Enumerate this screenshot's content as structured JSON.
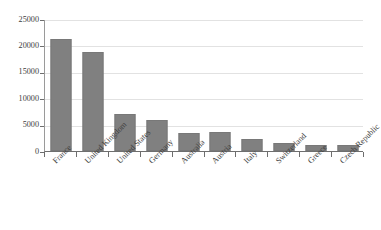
{
  "chart_data": {
    "type": "bar",
    "title": "",
    "xlabel": "",
    "ylabel": "",
    "grid": true,
    "legend": false,
    "ylim": [
      0,
      25000
    ],
    "ytick_values": [
      0,
      5000,
      10000,
      15000,
      20000,
      25000
    ],
    "ytick_labels": [
      "0",
      "5000",
      "10000",
      "15000",
      "20000",
      "25000"
    ],
    "bar_color": "#808080",
    "gridline_color": "#e2e2e2",
    "axis_color": "#6e6e6e",
    "background": "#ffffff",
    "categories": [
      "France",
      "United Kingdom",
      "United States",
      "Germany",
      "Australia",
      "Austria",
      "Italy",
      "Switzerland",
      "Greece",
      "Czech Republic"
    ],
    "values": [
      21200,
      18800,
      7100,
      5900,
      3500,
      3600,
      2300,
      1600,
      1100,
      1100
    ]
  }
}
